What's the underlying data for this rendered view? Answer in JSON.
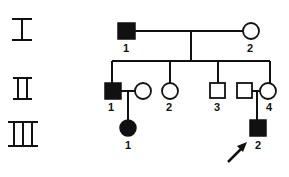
{
  "diagram": {
    "type": "pedigree",
    "colors": {
      "line": "#111111",
      "affected": "#111111",
      "unaffected": "#ffffff",
      "background": "#ffffff"
    },
    "generations": [
      {
        "label": "I",
        "y": 31
      },
      {
        "label": "II",
        "y": 91
      },
      {
        "label": "III",
        "y": 128
      }
    ],
    "individuals": [
      {
        "id": "I-1",
        "number": "1",
        "sex": "male",
        "affected": true
      },
      {
        "id": "I-2",
        "number": "2",
        "sex": "female",
        "affected": false
      },
      {
        "id": "II-1",
        "number": "1",
        "sex": "male",
        "affected": true
      },
      {
        "id": "II-1-spouse",
        "number": "",
        "sex": "female",
        "affected": false
      },
      {
        "id": "II-2",
        "number": "2",
        "sex": "female",
        "affected": false
      },
      {
        "id": "II-3",
        "number": "3",
        "sex": "male",
        "affected": false
      },
      {
        "id": "II-4-spouse",
        "number": "",
        "sex": "male",
        "affected": false
      },
      {
        "id": "II-4",
        "number": "4",
        "sex": "female",
        "affected": false
      },
      {
        "id": "III-1",
        "number": "1",
        "sex": "female",
        "affected": true
      },
      {
        "id": "III-2",
        "number": "2",
        "sex": "male",
        "affected": true,
        "proband": true
      }
    ],
    "proband_marker": "arrow"
  }
}
